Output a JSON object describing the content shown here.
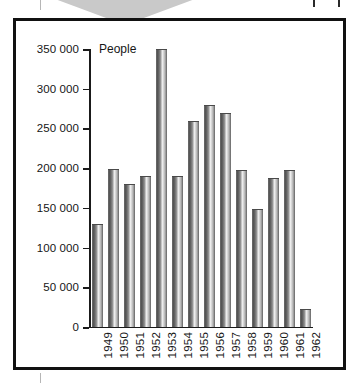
{
  "figure": {
    "axis_title": "People",
    "y_axis": {
      "ticks": [
        "0",
        "50 000",
        "100 000",
        "150 000",
        "200 000",
        "250 000",
        "300 000",
        "350 000"
      ],
      "min": 0,
      "max": 350000,
      "step": 50000
    },
    "artifacts": {
      "wedge_color": "#c9c9c9",
      "frame_color": "#111111",
      "bar_edge_color": "#4a4a4a",
      "text_color": "#161616"
    }
  },
  "chart_data": {
    "type": "bar",
    "title": "",
    "xlabel": "",
    "ylabel": "People",
    "ylim": [
      0,
      350000
    ],
    "grid": false,
    "legend": "none",
    "categories": [
      "1949",
      "1950",
      "1951",
      "1952",
      "1953",
      "1954",
      "1955",
      "1956",
      "1957",
      "1958",
      "1959",
      "1960",
      "1961",
      "1962"
    ],
    "values": [
      130000,
      199000,
      180000,
      190000,
      350000,
      190000,
      259000,
      279000,
      269000,
      198000,
      149000,
      188000,
      198000,
      23000
    ],
    "series": [
      {
        "name": "People",
        "values": [
          130000,
          199000,
          180000,
          190000,
          350000,
          190000,
          259000,
          279000,
          269000,
          198000,
          149000,
          188000,
          198000,
          23000
        ]
      }
    ]
  }
}
